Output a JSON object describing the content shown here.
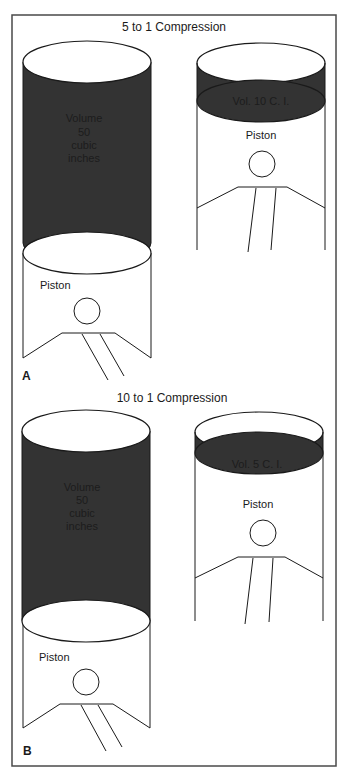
{
  "figure": {
    "panel_a": {
      "label": "A",
      "title": "5 to 1 Compression",
      "left_cylinder": {
        "volume_lines": [
          "Volume",
          "50",
          "cubic",
          "inches"
        ],
        "piston_label": "Piston"
      },
      "right_cylinder": {
        "volume_label": "Vol. 10 C. I.",
        "piston_label": "Piston"
      }
    },
    "panel_b": {
      "label": "B",
      "title": "10 to 1 Compression",
      "left_cylinder": {
        "volume_lines": [
          "Volume",
          "50",
          "cubic",
          "inches"
        ],
        "piston_label": "Piston"
      },
      "right_cylinder": {
        "volume_label": "Vol. 5 C. I.",
        "piston_label": "Piston"
      }
    }
  },
  "colors": {
    "frame": "#4a4a4a",
    "gas_fill": "#333333",
    "line": "#1a1a1a",
    "background": "#ffffff"
  }
}
